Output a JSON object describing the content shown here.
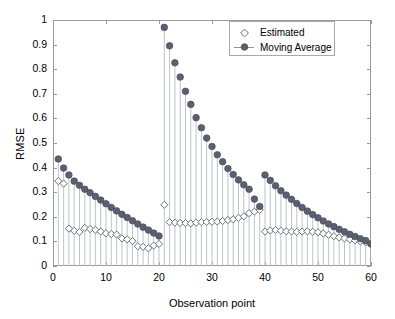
{
  "chart_data": {
    "type": "line",
    "title": "",
    "xlabel": "Observation point",
    "ylabel": "RMSE",
    "xlim": [
      0,
      60
    ],
    "ylim": [
      0,
      1
    ],
    "xticks": [
      0,
      10,
      20,
      30,
      40,
      50,
      60
    ],
    "yticks": [
      0,
      0.1,
      0.2,
      0.3,
      0.4,
      0.5,
      0.6,
      0.7,
      0.8,
      0.9,
      1
    ],
    "grid": false,
    "legend_position": "top-right",
    "legend": [
      "Estimated",
      "Moving Average"
    ],
    "marker_color": "#5b6070",
    "stem_color": "#b9bcc4",
    "x": [
      1,
      2,
      3,
      4,
      5,
      6,
      7,
      8,
      9,
      10,
      11,
      12,
      13,
      14,
      15,
      16,
      17,
      18,
      19,
      20,
      21,
      22,
      23,
      24,
      25,
      26,
      27,
      28,
      29,
      30,
      31,
      32,
      33,
      34,
      35,
      36,
      37,
      38,
      39,
      40,
      41,
      42,
      43,
      44,
      45,
      46,
      47,
      48,
      49,
      50,
      51,
      52,
      53,
      54,
      55,
      56,
      57,
      58,
      59,
      60
    ],
    "series": [
      {
        "name": "Estimated",
        "marker": "diamond-open",
        "values": [
          0.345,
          0.335,
          0.152,
          0.143,
          0.138,
          0.155,
          0.15,
          0.147,
          0.14,
          0.133,
          0.13,
          0.128,
          0.112,
          0.108,
          0.101,
          0.08,
          0.078,
          0.072,
          0.083,
          0.09,
          0.249,
          0.178,
          0.176,
          0.175,
          0.174,
          0.173,
          0.176,
          0.178,
          0.179,
          0.18,
          0.181,
          0.183,
          0.187,
          0.19,
          0.196,
          0.202,
          0.215,
          0.221,
          0.228,
          0.14,
          0.144,
          0.146,
          0.143,
          0.141,
          0.14,
          0.139,
          0.14,
          0.141,
          0.139,
          0.137,
          0.132,
          0.127,
          0.121,
          0.116,
          0.112,
          0.108,
          0.104,
          0.1,
          0.096,
          0.087
        ]
      },
      {
        "name": "Moving Average",
        "marker": "circle-filled",
        "values": [
          0.435,
          0.398,
          0.37,
          0.345,
          0.328,
          0.312,
          0.298,
          0.283,
          0.268,
          0.253,
          0.238,
          0.224,
          0.21,
          0.197,
          0.184,
          0.171,
          0.158,
          0.146,
          0.134,
          0.122,
          0.97,
          0.895,
          0.826,
          0.768,
          0.71,
          0.657,
          0.603,
          0.562,
          0.52,
          0.486,
          0.452,
          0.424,
          0.396,
          0.372,
          0.35,
          0.33,
          0.312,
          0.272,
          0.242,
          0.37,
          0.348,
          0.326,
          0.306,
          0.288,
          0.271,
          0.254,
          0.238,
          0.223,
          0.209,
          0.196,
          0.183,
          0.171,
          0.16,
          0.149,
          0.139,
          0.129,
          0.12,
          0.111,
          0.103,
          0.09
        ]
      }
    ]
  },
  "axis": {
    "ytick_labels": [
      "1",
      "0.9",
      "0.8",
      "0.7",
      "0.6",
      "0.5",
      "0.4",
      "0.3",
      "0.2",
      "0.1",
      "0"
    ],
    "xtick_labels": [
      "0",
      "10",
      "20",
      "30",
      "40",
      "50",
      "60"
    ]
  }
}
